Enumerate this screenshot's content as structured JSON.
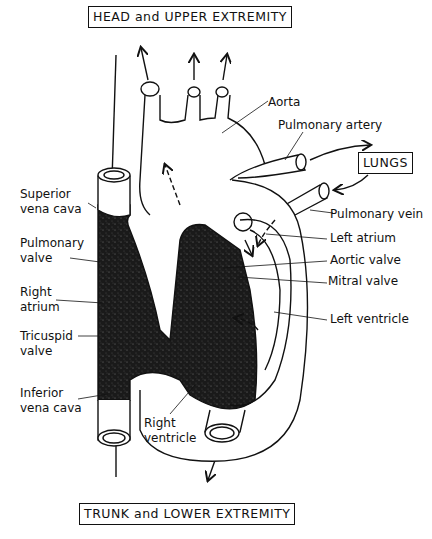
{
  "diagram": {
    "title_top": "HEAD and UPPER EXTREMITY",
    "title_bottom": "TRUNK and LOWER EXTREMITY",
    "lungs_box": "LUNGS",
    "labels": {
      "aorta": "Aorta",
      "pulmonary_artery": "Pulmonary artery",
      "superior_vena_cava_1": "Superior",
      "superior_vena_cava_2": "vena cava",
      "pulmonary_vein": "Pulmonary vein",
      "pulmonary_valve_1": "Pulmonary",
      "pulmonary_valve_2": "valve",
      "left_atrium": "Left atrium",
      "aortic_valve": "Aortic valve",
      "mitral_valve": "Mitral valve",
      "right_atrium_1": "Right",
      "right_atrium_2": "atrium",
      "left_ventricle": "Left ventricle",
      "tricuspid_valve_1": "Tricuspid",
      "tricuspid_valve_2": "valve",
      "inferior_vena_cava_1": "Inferior",
      "inferior_vena_cava_2": "vena cava",
      "right_ventricle_1": "Right",
      "right_ventricle_2": "ventricle"
    },
    "colors": {
      "ink": "#111111",
      "deoxygenated_fill": "#1a1a1a",
      "background": "#ffffff"
    }
  }
}
